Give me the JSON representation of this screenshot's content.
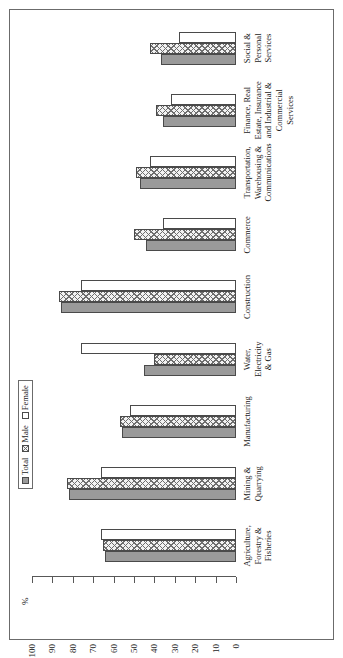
{
  "legend": {
    "position": "top-left",
    "entries": [
      {
        "label": "Total",
        "pattern": "solid-gray",
        "color": "#9a9a9a"
      },
      {
        "label": "Male",
        "pattern": "crosshatch",
        "color": "#f2f2f2"
      },
      {
        "label": "Female",
        "pattern": "empty-white",
        "color": "#ffffff"
      }
    ]
  },
  "axis": {
    "unit_label": "%",
    "ticks": [
      "100",
      "90",
      "80",
      "70",
      "60",
      "50",
      "40",
      "30",
      "20",
      "10",
      "0"
    ]
  },
  "chart_data": {
    "type": "bar",
    "title": "",
    "subtitle": "",
    "xlabel": "",
    "ylabel": "%",
    "ylim": [
      0,
      100
    ],
    "grid": false,
    "orientation": "vertical-bars-rotated-90ccw",
    "legend_position": "top-left",
    "categories": [
      "Agriculture, Forestry & Fisheries",
      "Mining & Quarrying",
      "Manufacturing",
      "Water, Electricity & Gas",
      "Construction",
      "Commerce",
      "Transportation, Warehousing & Communications",
      "Finance, Real Estate, Insurance and Industrial & Commercial Services",
      "Social & Personal Services"
    ],
    "category_labels_multiline": [
      "Agriculture,\nForestry &\nFisheries",
      "Mining &\nQuarrying",
      "Manufacturing",
      "Water,\nElectricity\n& Gas",
      "Construction",
      "Commerce",
      "Transportation,\nWarehousing &\nCommunications",
      "Finance, Real\nEstate, Insurance\nand Industrial &\nCommercial\nServices",
      "Social &\nPersonal\nServices"
    ],
    "series": [
      {
        "name": "Total",
        "values": [
          64,
          82,
          56,
          45,
          86,
          44,
          47,
          36,
          37
        ]
      },
      {
        "name": "Male",
        "values": [
          65,
          83,
          57,
          40,
          87,
          50,
          49,
          39,
          42
        ]
      },
      {
        "name": "Female",
        "values": [
          66,
          66,
          52,
          76,
          76,
          36,
          42,
          32,
          28
        ]
      }
    ]
  }
}
